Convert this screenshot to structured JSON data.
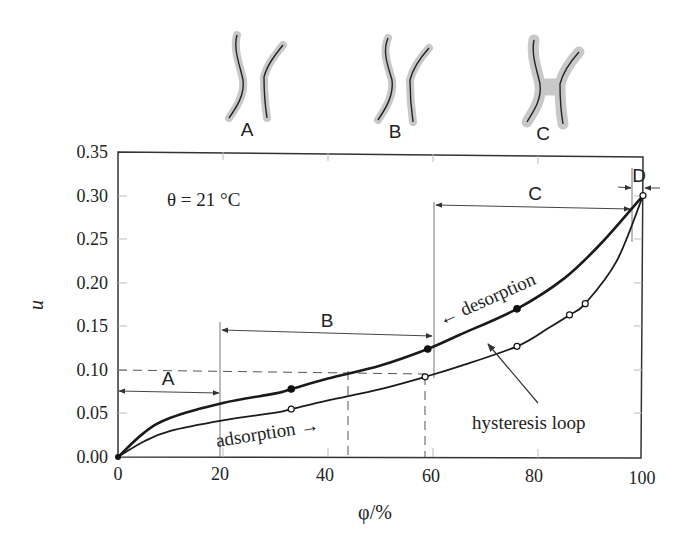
{
  "figure": {
    "pore_sketches": [
      {
        "label": "A",
        "x": 247
      },
      {
        "label": "B",
        "x": 395
      },
      {
        "label": "C",
        "x": 543
      }
    ],
    "annotation_temperature": "θ = 21 °C",
    "label_adsorption": "adsorption →",
    "label_desorption": "← desorption",
    "label_hysteresis": "hysteresis loop",
    "colors": {
      "line": "#1a1a1a",
      "axis": "#333333",
      "sketch_band": "#c8c8c8",
      "guide": "#555555"
    }
  },
  "chart_data": {
    "type": "line",
    "title": "",
    "xlabel": "φ/%",
    "ylabel": "u",
    "xlim": [
      0,
      100
    ],
    "ylim": [
      0,
      0.35
    ],
    "xticks": [
      "0",
      "20",
      "40",
      "60",
      "80",
      "100"
    ],
    "yticks": [
      "0.00",
      "0.05",
      "0.10",
      "0.15",
      "0.20",
      "0.25",
      "0.30",
      "0.35"
    ],
    "grid": false,
    "annotations": [
      "θ = 21 °C",
      "adsorption →",
      "← desorption",
      "hysteresis loop"
    ],
    "regions": [
      {
        "label": "A",
        "from": 0,
        "to": 20
      },
      {
        "label": "B",
        "from": 20,
        "to": 61
      },
      {
        "label": "C",
        "from": 61,
        "to": 98
      },
      {
        "label": "D",
        "from": 98,
        "to": 100
      }
    ],
    "reference_lines": [
      {
        "type": "horizontal-dashed",
        "y": 0.1,
        "x_to": 59
      },
      {
        "type": "vertical-dashed",
        "x": 45,
        "y_to": 0.1
      },
      {
        "type": "vertical-dashed",
        "x": 58.5,
        "y_to": 0.092
      }
    ],
    "series": [
      {
        "name": "desorption",
        "marker": "filled-circle",
        "curve": [
          [
            0,
            0.0
          ],
          [
            5,
            0.028
          ],
          [
            10,
            0.045
          ],
          [
            20,
            0.062
          ],
          [
            30,
            0.073
          ],
          [
            33,
            0.078
          ],
          [
            40,
            0.09
          ],
          [
            50,
            0.105
          ],
          [
            59,
            0.124
          ],
          [
            65,
            0.14
          ],
          [
            76,
            0.17
          ],
          [
            85,
            0.205
          ],
          [
            92,
            0.245
          ],
          [
            100,
            0.3
          ]
        ],
        "points": [
          [
            33,
            0.078
          ],
          [
            59,
            0.124
          ],
          [
            76,
            0.17
          ]
        ]
      },
      {
        "name": "adsorption",
        "marker": "open-circle",
        "curve": [
          [
            0,
            0.0
          ],
          [
            5,
            0.018
          ],
          [
            10,
            0.03
          ],
          [
            20,
            0.042
          ],
          [
            30,
            0.051
          ],
          [
            33,
            0.055
          ],
          [
            40,
            0.065
          ],
          [
            50,
            0.078
          ],
          [
            58.5,
            0.092
          ],
          [
            65,
            0.104
          ],
          [
            76,
            0.127
          ],
          [
            82,
            0.148
          ],
          [
            86,
            0.163
          ],
          [
            89,
            0.176
          ],
          [
            95,
            0.225
          ],
          [
            100,
            0.3
          ]
        ],
        "points": [
          [
            33,
            0.055
          ],
          [
            58.5,
            0.092
          ],
          [
            76,
            0.127
          ],
          [
            86,
            0.163
          ],
          [
            89,
            0.176
          ],
          [
            100,
            0.3
          ]
        ]
      }
    ]
  }
}
